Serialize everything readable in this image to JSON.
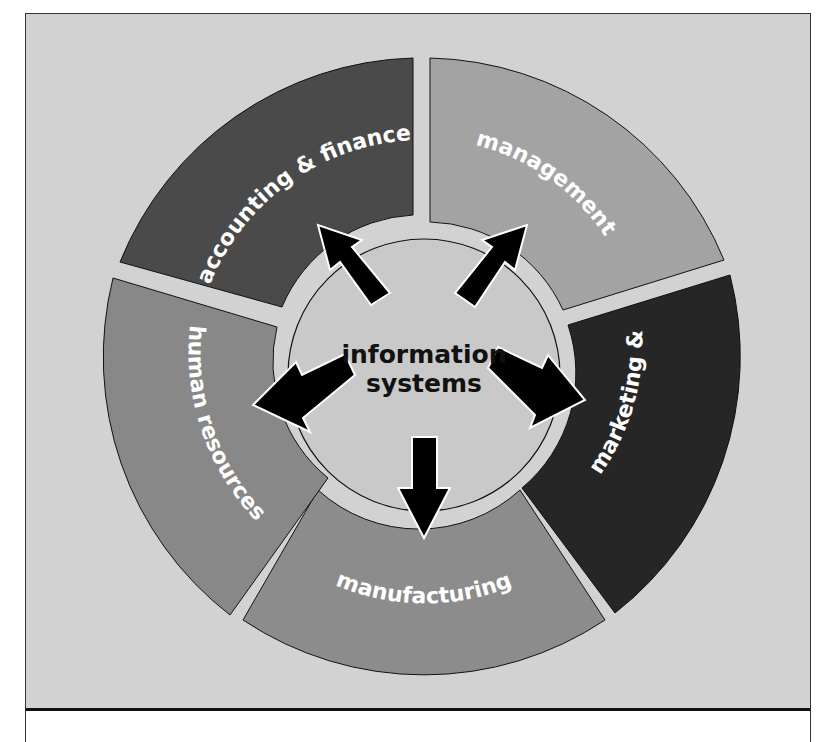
{
  "diagram": {
    "center": {
      "label_line1": "information",
      "label_line2": "systems",
      "fill": "#c9c9c9"
    },
    "segments": [
      {
        "id": "accounting",
        "label": "accounting & finance",
        "fill": "#4a4a4a"
      },
      {
        "id": "management",
        "label": "management",
        "fill": "#a3a3a3"
      },
      {
        "id": "marketing",
        "label": "marketing & sales",
        "fill": "#262626"
      },
      {
        "id": "manufacturing",
        "label": "manufacturing",
        "fill": "#8c8c8c"
      },
      {
        "id": "human-resources",
        "label": "human resources",
        "fill": "#888888"
      }
    ],
    "arrows": [
      "to-accounting",
      "to-management",
      "to-marketing",
      "to-manufacturing",
      "to-human-resources"
    ],
    "background": "#d2d2d2"
  }
}
